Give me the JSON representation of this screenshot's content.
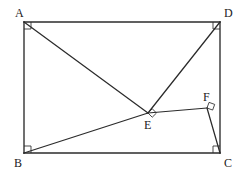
{
  "figure": {
    "kind": "geometry-diagram",
    "shape": "rectangle-with-cevians",
    "stroke_color": "#2b2b2b",
    "background_color": "#ffffff",
    "label_color": "#1a1a1a"
  },
  "points": {
    "A": {
      "label": "A",
      "x": 24,
      "y": 22,
      "label_x": 15,
      "label_y": 17
    },
    "B": {
      "label": "B",
      "x": 24,
      "y": 153,
      "label_x": 14,
      "label_y": 167
    },
    "C": {
      "label": "C",
      "x": 220,
      "y": 153,
      "label_x": 224,
      "label_y": 167
    },
    "D": {
      "label": "D",
      "x": 220,
      "y": 22,
      "label_x": 224,
      "label_y": 17
    },
    "E": {
      "label": "E",
      "x": 148,
      "y": 113,
      "label_x": 144,
      "label_y": 129
    },
    "F": {
      "label": "F",
      "x": 207,
      "y": 108,
      "label_x": 203,
      "label_y": 101
    }
  },
  "segments": [
    {
      "name": "side-AD",
      "from": "A",
      "to": "D"
    },
    {
      "name": "side-DC",
      "from": "D",
      "to": "C"
    },
    {
      "name": "side-CB",
      "from": "C",
      "to": "B"
    },
    {
      "name": "side-BA",
      "from": "B",
      "to": "A"
    },
    {
      "name": "segment-AE",
      "from": "A",
      "to": "E"
    },
    {
      "name": "segment-DE",
      "from": "D",
      "to": "E"
    },
    {
      "name": "segment-BE",
      "from": "B",
      "to": "E"
    },
    {
      "name": "segment-EF",
      "from": "E",
      "to": "F"
    },
    {
      "name": "segment-FC",
      "from": "F",
      "to": "C"
    }
  ],
  "right_angles": [
    {
      "name": "right-angle-A",
      "vertex": "A",
      "size": 7,
      "style": "corner",
      "dx": 1,
      "dy": 1
    },
    {
      "name": "right-angle-B",
      "vertex": "B",
      "size": 7,
      "style": "corner",
      "dx": 1,
      "dy": -1
    },
    {
      "name": "right-angle-C",
      "vertex": "C",
      "size": 7,
      "style": "corner",
      "dx": -1,
      "dy": -1
    },
    {
      "name": "right-angle-D",
      "vertex": "D",
      "size": 7,
      "style": "corner",
      "dx": -1,
      "dy": 1
    },
    {
      "name": "right-angle-E",
      "vertex": "E",
      "size": 6,
      "style": "rotated",
      "angle": 45
    },
    {
      "name": "right-angle-F",
      "vertex": "F",
      "size": 6,
      "style": "rotated",
      "angle": 20
    }
  ]
}
